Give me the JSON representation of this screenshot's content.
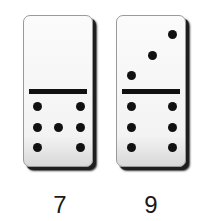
{
  "dominoes": [
    {
      "label": "7",
      "top_pips": 0,
      "bottom_pips": 6,
      "top_dots": [],
      "bottom_dots": [
        [
          13,
          17
        ],
        [
          51,
          17
        ],
        [
          13,
          38
        ],
        [
          32,
          38
        ],
        [
          51,
          38
        ],
        [
          13,
          58
        ],
        [
          51,
          58
        ]
      ]
    },
    {
      "label": "9",
      "top_pips": 3,
      "bottom_pips": 6,
      "top_dots": [
        [
          55,
          18
        ],
        [
          35,
          39
        ],
        [
          14,
          59
        ]
      ],
      "bottom_dots": [
        [
          14,
          17
        ],
        [
          52,
          17
        ],
        [
          14,
          38
        ],
        [
          52,
          38
        ],
        [
          14,
          58
        ],
        [
          52,
          58
        ]
      ]
    }
  ],
  "colors": {
    "pip": "#111111",
    "tile": "#f7f7f7",
    "shadow": "#1e1e1e"
  }
}
